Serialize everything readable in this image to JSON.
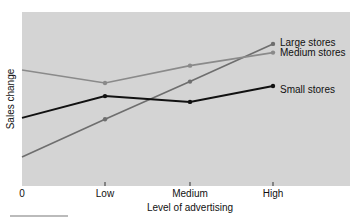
{
  "chart_data": {
    "type": "line",
    "title": "",
    "xlabel": "Level of advertising",
    "ylabel": "Sales change",
    "categories": [
      "0",
      "Low",
      "Medium",
      "High"
    ],
    "series": [
      {
        "name": "Large stores",
        "values": [
          1.0,
          2.3,
          3.6,
          4.9
        ],
        "color": "#6e6e6e"
      },
      {
        "name": "Medium stores",
        "values": [
          4.0,
          3.55,
          4.15,
          4.6
        ],
        "color": "#8a8a8a"
      },
      {
        "name": "Small stores",
        "values": [
          2.35,
          3.1,
          2.9,
          3.45
        ],
        "color": "#111111"
      }
    ],
    "ylim": [
      0,
      6
    ],
    "grid": false,
    "legend_position": "inline-right",
    "y_ticks_shown": false,
    "background": "#d4d4d4"
  },
  "labels": {
    "x_ticks": [
      "0",
      "Low",
      "Medium",
      "High"
    ],
    "xlabel": "Level of advertising",
    "ylabel": "Sales change",
    "legend": [
      "Large stores",
      "Medium stores",
      "Small stores"
    ]
  }
}
